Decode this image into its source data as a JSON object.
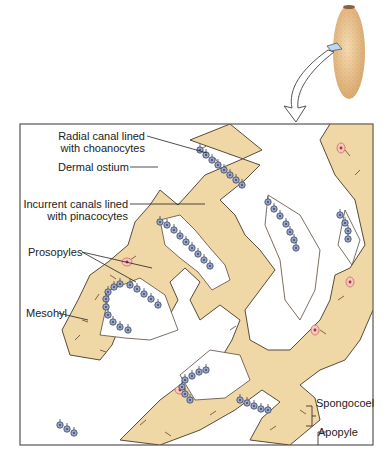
{
  "figure": {
    "inset_icon": "sponge-body-icon",
    "labels": {
      "radial_canal_line1": "Radial canal lined",
      "radial_canal_line2": "with choanocytes",
      "dermal_ostium": "Dermal ostium",
      "incurrent_line1": "Incurrent canals lined",
      "incurrent_line2": "with pinacocytes",
      "prosopyles": "Prosopyles",
      "mesohyl": "Mesohyl",
      "spongocoel": "Spongocoel",
      "apopyle": "Apopyle"
    },
    "colors": {
      "tissue": "#f0d7a6",
      "tissue_outline": "#5a4a3a",
      "choanocyte": "#9aa6c6",
      "choanocyte_outline": "#3c4668",
      "spicule": "#6b5a40",
      "cell_nucleus": "#e8a0a0",
      "sponge_body": "#eac08a",
      "frame": "#555555"
    }
  }
}
